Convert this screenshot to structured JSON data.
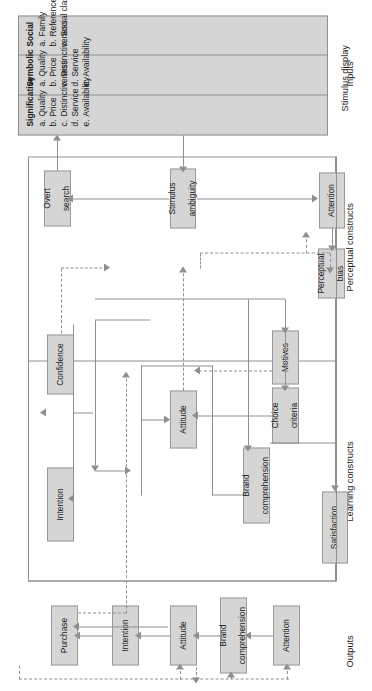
{
  "diagram": {
    "colors": {
      "box_fill": "#d5d5d5",
      "box_stroke": "#9a9a9a",
      "line": "#8f8f8f",
      "text": "#1a1a1a",
      "background": "#ffffff"
    },
    "row_labels": {
      "outputs": "Outputs",
      "learning": "Learning constructs",
      "perceptual": "Perceptual constructs",
      "inputs": "Inputs"
    },
    "outputs": {
      "boxes": [
        {
          "id": "purchase",
          "label": "Purchase"
        },
        {
          "id": "intention",
          "label": "Intention"
        },
        {
          "id": "attitude",
          "label": "Attitude"
        },
        {
          "id": "brand-comprehension",
          "label": "Brand comprehension",
          "line1": "Brand",
          "line2": "comprehension"
        },
        {
          "id": "attention",
          "label": "Attention"
        }
      ]
    },
    "learning_constructs": {
      "boxes": [
        {
          "id": "intention",
          "label": "Intention"
        },
        {
          "id": "confidence",
          "label": "Confidence"
        },
        {
          "id": "attitude",
          "label": "Attitude"
        },
        {
          "id": "brand-comprehension",
          "line1": "Brand",
          "line2": "comprehension"
        },
        {
          "id": "choice-criteria",
          "line1": "Choice",
          "line2": "criteria"
        },
        {
          "id": "motives",
          "label": "Motives"
        },
        {
          "id": "satisfaction",
          "label": "Satisfaction"
        }
      ]
    },
    "perceptual_constructs": {
      "boxes": [
        {
          "id": "overt-search",
          "line1": "Overt",
          "line2": "search"
        },
        {
          "id": "stimulus-ambiguity",
          "line1": "Stimulus",
          "line2": "ambiguity"
        },
        {
          "id": "attention",
          "label": "Attention"
        },
        {
          "id": "perceptual-bias",
          "line1": "Perceptual",
          "line2": "bias"
        }
      ]
    },
    "inputs": {
      "panel_title": "Stimulus display",
      "columns": [
        {
          "heading": "Significative",
          "items": [
            {
              "key": "a.",
              "text": "Quality"
            },
            {
              "key": "b.",
              "text": "Price"
            },
            {
              "key": "c.",
              "text": "Distinctiveness"
            },
            {
              "key": "d.",
              "text": "Service"
            },
            {
              "key": "e.",
              "text": "Availability"
            }
          ]
        },
        {
          "heading": "Symbolic",
          "items": [
            {
              "key": "a.",
              "text": "Quality"
            },
            {
              "key": "b.",
              "text": "Price"
            },
            {
              "key": "c.",
              "text": "Distinctiveness"
            },
            {
              "key": "d.",
              "text": "Service"
            },
            {
              "key": "e.",
              "text": "Availability"
            }
          ]
        },
        {
          "heading": "Social",
          "items": [
            {
              "key": "a.",
              "text": "Family"
            },
            {
              "key": "b.",
              "text": "Reference groups"
            },
            {
              "key": "c.",
              "text": "Social class"
            }
          ]
        }
      ]
    }
  }
}
